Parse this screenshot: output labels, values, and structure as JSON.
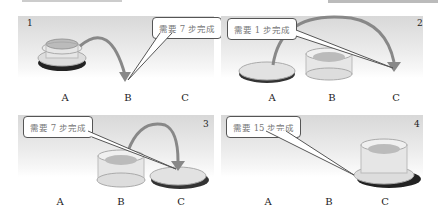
{
  "panels": [
    {
      "number": "1",
      "callout": "需要 7 步完成",
      "pegs": [
        "A",
        "B",
        "C"
      ],
      "stack_on": "A",
      "move": "A→B"
    },
    {
      "number": "2",
      "callout": "需要 1 步完成",
      "pegs": [
        "A",
        "B",
        "C"
      ],
      "stack_on": "B",
      "single_disk_on": "A",
      "move": "A→C"
    },
    {
      "number": "3",
      "callout": "需要 7 步完成",
      "pegs": [
        "A",
        "B",
        "C"
      ],
      "stack_on": "B",
      "single_disk_on": "C",
      "move": "B→C"
    },
    {
      "number": "4",
      "callout": "需要 15 步完成",
      "pegs": [
        "A",
        "B",
        "C"
      ],
      "stack_on": "C"
    }
  ],
  "colors": {
    "callout_border": "#555555",
    "arrow": "#8a8a8a",
    "disk_light": "#e8e8e8",
    "disk_dark": "#2a2a2a"
  }
}
